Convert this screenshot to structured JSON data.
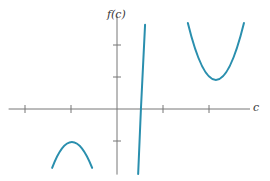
{
  "chart_data": {
    "type": "line",
    "title": "",
    "xlabel": "c",
    "ylabel": "f(c)",
    "xlim": [
      -2.4,
      2.9
    ],
    "ylim": [
      -2.05,
      2.9
    ],
    "x_ticks": [
      -2,
      -1,
      1,
      2
    ],
    "y_ticks": [
      -1,
      1,
      2
    ],
    "tick_labels_shown": false,
    "grid": false,
    "legend": null,
    "curve_color": "#2a8fae",
    "axis_color": "#777777",
    "series": [
      {
        "name": "left-branch-downward-parabola",
        "points": [
          [
            -1.41,
            -1.84
          ],
          [
            -1.2,
            -1.2
          ],
          [
            -0.98,
            -1.03
          ],
          [
            -0.76,
            -1.2
          ],
          [
            -0.54,
            -1.84
          ]
        ],
        "vertex": [
          -0.98,
          -1.03
        ]
      },
      {
        "name": "middle-steep-branch",
        "points": [
          [
            0.46,
            -2.03
          ],
          [
            0.52,
            0.0
          ],
          [
            0.61,
            2.63
          ]
        ],
        "x_intercept": 0.52
      },
      {
        "name": "right-branch-upward-parabola",
        "points": [
          [
            1.54,
            2.69
          ],
          [
            1.85,
            1.35
          ],
          [
            2.15,
            0.91
          ],
          [
            2.45,
            1.35
          ],
          [
            2.76,
            2.69
          ]
        ],
        "vertex": [
          2.15,
          0.91
        ]
      }
    ]
  }
}
